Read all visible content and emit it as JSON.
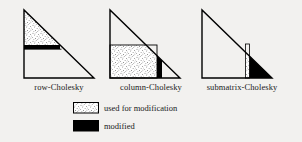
{
  "figure": {
    "caption_labels": {
      "row": "row-Cholesky",
      "column": "column-Cholesky",
      "submatrix": "submatrix-Cholesky"
    },
    "legend": {
      "used_label": "used for modification",
      "modified_label": "modified",
      "used_fill": "stipple",
      "modified_fill": "#000000"
    },
    "colors": {
      "background": "#f2f1ef",
      "outline": "#000000",
      "modified": "#000000",
      "stipple_dot": "#2b2b2b",
      "stipple_bg": "#ffffff"
    },
    "variants": [
      {
        "name": "row-Cholesky",
        "used_region": "upper triangle above active row",
        "modified_region": "horizontal row band"
      },
      {
        "name": "column-Cholesky",
        "used_region": "lower-left rectangle left of active column",
        "modified_region": "vertical column band"
      },
      {
        "name": "submatrix-Cholesky",
        "used_region": "thin vertical column strip",
        "modified_region": "trailing lower-right submatrix triangle"
      }
    ]
  }
}
